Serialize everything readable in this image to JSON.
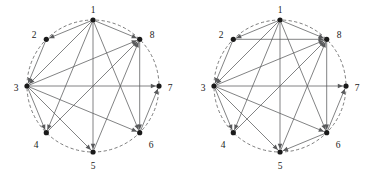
{
  "figure": {
    "kind": "two-directed-graphs-on-circle",
    "background_color": "#ffffff",
    "edge_color": "#58595b",
    "node_color": "#1a1a1a",
    "circle_color": "#5a5a5a",
    "node_radius_px": 2.6,
    "arrow_length_px": 5.2,
    "panels": [
      {
        "name": "left-graph",
        "center": {
          "x": 93,
          "y": 86
        },
        "radius": 66,
        "node_labels": [
          "1",
          "2",
          "3",
          "4",
          "5",
          "6",
          "7",
          "8"
        ],
        "nodes": [
          {
            "id": 1,
            "label": "1",
            "angle_deg": 90,
            "x": 93,
            "y": 20,
            "label_x": 93,
            "label_y": 11,
            "label_anchor": "middle"
          },
          {
            "id": 2,
            "label": "2",
            "angle_deg": 135,
            "x": 46.3,
            "y": 39.3,
            "label_x": 34,
            "label_y": 36,
            "label_anchor": "middle"
          },
          {
            "id": 3,
            "label": "3",
            "angle_deg": 180,
            "x": 27,
            "y": 86,
            "label_x": 16,
            "label_y": 89,
            "label_anchor": "middle"
          },
          {
            "id": 4,
            "label": "4",
            "angle_deg": 225,
            "x": 46.3,
            "y": 132.7,
            "label_x": 36,
            "label_y": 146,
            "label_anchor": "middle"
          },
          {
            "id": 5,
            "label": "5",
            "angle_deg": 270,
            "x": 93,
            "y": 152,
            "label_x": 93,
            "label_y": 167,
            "label_anchor": "middle"
          },
          {
            "id": 6,
            "label": "6",
            "angle_deg": 315,
            "x": 139.7,
            "y": 132.7,
            "label_x": 151,
            "label_y": 146,
            "label_anchor": "middle"
          },
          {
            "id": 7,
            "label": "7",
            "angle_deg": 0,
            "x": 159,
            "y": 86,
            "label_x": 170,
            "label_y": 89,
            "label_anchor": "middle"
          },
          {
            "id": 8,
            "label": "8",
            "angle_deg": 45,
            "x": 139.7,
            "y": 39.3,
            "label_x": 152,
            "label_y": 36,
            "label_anchor": "middle"
          }
        ],
        "edges": [
          {
            "from": 1,
            "to": 2
          },
          {
            "from": 1,
            "to": 3
          },
          {
            "from": 1,
            "to": 4
          },
          {
            "from": 1,
            "to": 5
          },
          {
            "from": 1,
            "to": 6
          },
          {
            "from": 1,
            "to": 8
          },
          {
            "from": 2,
            "to": 3
          },
          {
            "from": 3,
            "to": 4
          },
          {
            "from": 3,
            "to": 5
          },
          {
            "from": 3,
            "to": 6
          },
          {
            "from": 3,
            "to": 7
          },
          {
            "from": 3,
            "to": 8
          },
          {
            "from": 4,
            "to": 8
          },
          {
            "from": 5,
            "to": 8
          },
          {
            "from": 6,
            "to": 7
          },
          {
            "from": 8,
            "to": 6
          }
        ]
      },
      {
        "name": "right-graph",
        "center": {
          "x": 93,
          "y": 86
        },
        "radius": 66,
        "node_labels": [
          "1",
          "2",
          "3",
          "4",
          "5",
          "6",
          "7",
          "8"
        ],
        "nodes": [
          {
            "id": 1,
            "label": "1",
            "angle_deg": 90,
            "x": 93,
            "y": 20,
            "label_x": 93,
            "label_y": 11,
            "label_anchor": "middle"
          },
          {
            "id": 2,
            "label": "2",
            "angle_deg": 135,
            "x": 46.3,
            "y": 39.3,
            "label_x": 34,
            "label_y": 36,
            "label_anchor": "middle"
          },
          {
            "id": 3,
            "label": "3",
            "angle_deg": 180,
            "x": 27,
            "y": 86,
            "label_x": 16,
            "label_y": 89,
            "label_anchor": "middle"
          },
          {
            "id": 4,
            "label": "4",
            "angle_deg": 225,
            "x": 46.3,
            "y": 132.7,
            "label_x": 36,
            "label_y": 146,
            "label_anchor": "middle"
          },
          {
            "id": 5,
            "label": "5",
            "angle_deg": 270,
            "x": 93,
            "y": 152,
            "label_x": 93,
            "label_y": 167,
            "label_anchor": "middle"
          },
          {
            "id": 6,
            "label": "6",
            "angle_deg": 315,
            "x": 139.7,
            "y": 132.7,
            "label_x": 151,
            "label_y": 146,
            "label_anchor": "middle"
          },
          {
            "id": 7,
            "label": "7",
            "angle_deg": 0,
            "x": 159,
            "y": 86,
            "label_x": 170,
            "label_y": 89,
            "label_anchor": "middle"
          },
          {
            "id": 8,
            "label": "8",
            "angle_deg": 45,
            "x": 139.7,
            "y": 39.3,
            "label_x": 152,
            "label_y": 36,
            "label_anchor": "middle"
          }
        ],
        "edges": [
          {
            "from": 1,
            "to": 2
          },
          {
            "from": 1,
            "to": 3
          },
          {
            "from": 1,
            "to": 4
          },
          {
            "from": 1,
            "to": 5
          },
          {
            "from": 1,
            "to": 6
          },
          {
            "from": 1,
            "to": 8
          },
          {
            "from": 2,
            "to": 3
          },
          {
            "from": 2,
            "to": 8
          },
          {
            "from": 3,
            "to": 4
          },
          {
            "from": 3,
            "to": 5
          },
          {
            "from": 3,
            "to": 6
          },
          {
            "from": 3,
            "to": 7
          },
          {
            "from": 3,
            "to": 8
          },
          {
            "from": 4,
            "to": 8
          },
          {
            "from": 5,
            "to": 8
          },
          {
            "from": 6,
            "to": 5
          },
          {
            "from": 6,
            "to": 7
          },
          {
            "from": 8,
            "to": 6
          }
        ]
      }
    ]
  }
}
